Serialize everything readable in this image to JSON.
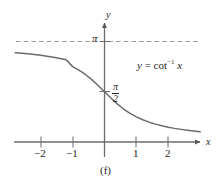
{
  "figure": {
    "caption": "(f)",
    "equation": {
      "lhs": "y",
      "equals": "=",
      "function": "cot",
      "exponent": "−1",
      "argument": "x"
    }
  },
  "axes": {
    "x_axis_label": "x",
    "y_axis_label": "y",
    "x_ticks": [
      "−2",
      "−1",
      "1",
      "2"
    ],
    "x_tick_values": [
      -2,
      -1,
      1,
      2
    ],
    "y_labels": {
      "pi": "π",
      "pi_over_two_numerator": "π",
      "pi_over_two_denominator": "2"
    }
  },
  "colors": {
    "curve": "#6b6b6b",
    "axis": "#6b6b6b",
    "asymptote": "#9a9a9a",
    "text": "#262626",
    "background": "#ffffff"
  },
  "chart_data": {
    "type": "line",
    "title": "",
    "subtitle": "",
    "xlabel": "x",
    "ylabel": "y",
    "legend": [
      "y = cot⁻¹ x"
    ],
    "annotations": [
      {
        "text": "π",
        "role": "horizontal-asymptote-label",
        "y": 3.14159
      },
      {
        "text": "π/2",
        "role": "y-intercept-label",
        "x": 0,
        "y": 1.5708
      },
      {
        "text": "y = cot⁻¹ x",
        "role": "curve-equation"
      },
      {
        "text": "(f)",
        "role": "figure-caption"
      }
    ],
    "grid": false,
    "legend_position": "inside-upper-right",
    "xlim": [
      -2.8,
      3.05
    ],
    "ylim": [
      0,
      3.6
    ],
    "xticks": [
      -2,
      -1,
      1,
      2
    ],
    "yticks": [
      1.5708,
      3.14159
    ],
    "ytick_labels": [
      "π/2",
      "π"
    ],
    "asymptotes": [
      {
        "type": "horizontal",
        "y": 3.14159,
        "style": "dashed"
      },
      {
        "type": "horizontal",
        "y": 0,
        "style": "solid-axis"
      }
    ],
    "series": [
      {
        "name": "y = cot^-1 x",
        "formula": "y = arccot(x), range (0, pi)",
        "x": [
          -2.8,
          -2.6,
          -2.4,
          -2.2,
          -2.0,
          -1.8,
          -1.6,
          -1.4,
          -1.2,
          -1.0,
          -0.8,
          -0.6,
          -0.4,
          -0.2,
          0.0,
          0.2,
          0.4,
          0.6,
          0.8,
          1.0,
          1.2,
          1.4,
          1.6,
          1.8,
          2.0,
          2.2,
          2.4,
          2.6,
          2.8,
          3.0
        ],
        "y": [
          2.7918,
          2.7754,
          2.7566,
          2.735,
          2.7104,
          2.6822,
          2.6499,
          2.6131,
          2.5713,
          2.3562,
          2.2455,
          2.1112,
          1.9513,
          1.7682,
          1.5708,
          1.3734,
          1.1903,
          1.0304,
          0.8961,
          0.7854,
          0.6947,
          0.6202,
          0.5586,
          0.5071,
          0.4636,
          0.4259,
          0.3948,
          0.3672,
          0.343,
          0.3217
        ]
      }
    ]
  }
}
